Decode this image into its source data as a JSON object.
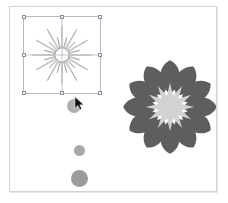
{
  "app": {
    "title": "Vector Drawing Canvas",
    "background_color": "#ffffff"
  },
  "canvas": {
    "name": "drawing-canvas",
    "background_color": "#ffffff",
    "border_color": "#d3d3d3",
    "shadow_color": "#e6e6e6",
    "x": 9,
    "y": 6,
    "width": 208,
    "height": 186
  },
  "selection": {
    "name": "selection-frame",
    "frame_color": "#b9b9c4",
    "guide_color": "#c3c3cd",
    "handle_fill": "#f3f3f6",
    "handle_stroke": "#8e8e9c",
    "handle_count": 8,
    "x": 13,
    "y": 9,
    "width": 78,
    "height": 78,
    "handles": [
      "handle-nw",
      "handle-n",
      "handle-ne",
      "handle-w",
      "handle-e",
      "handle-sw",
      "handle-s",
      "handle-se"
    ]
  },
  "objects": {
    "starburst": {
      "name": "starburst-shape",
      "label": "Starburst",
      "selected": true,
      "stroke_color": "#6e6e74",
      "fill_color": "none",
      "spike_count": 24,
      "outer_radius": 38,
      "inner_radius": 9,
      "center_dot_color": "#6e6e74",
      "x": 13,
      "y": 9,
      "width": 78,
      "height": 78
    },
    "flower": {
      "name": "flower-shape",
      "label": "Flower",
      "selected": false,
      "petal_color": "#5e5e5e",
      "center_color": "#d2d2d2",
      "petal_count": 12,
      "center_point_count": 12,
      "petal_outer_radius": 52,
      "petal_inner_radius": 15,
      "center_outer_radius": 27,
      "center_inner_radius": 13,
      "x": 106,
      "y": 46,
      "width": 108,
      "height": 108
    },
    "circles": [
      {
        "name": "circle-large-top",
        "label": "Circle 1",
        "color": "#b0b0b0",
        "x": 57,
        "y": 92,
        "diameter": 14
      },
      {
        "name": "circle-small-middle",
        "label": "Circle 2",
        "color": "#a8a8a8",
        "x": 64,
        "y": 138,
        "diameter": 11
      },
      {
        "name": "circle-large-bottom",
        "label": "Circle 3",
        "color": "#9b9b9b",
        "x": 61,
        "y": 163,
        "diameter": 17
      }
    ]
  },
  "cursor": {
    "name": "mouse-cursor",
    "type": "arrow-pointer",
    "color": "#111111",
    "outline_color": "#ffffff",
    "x": 64,
    "y": 89
  }
}
